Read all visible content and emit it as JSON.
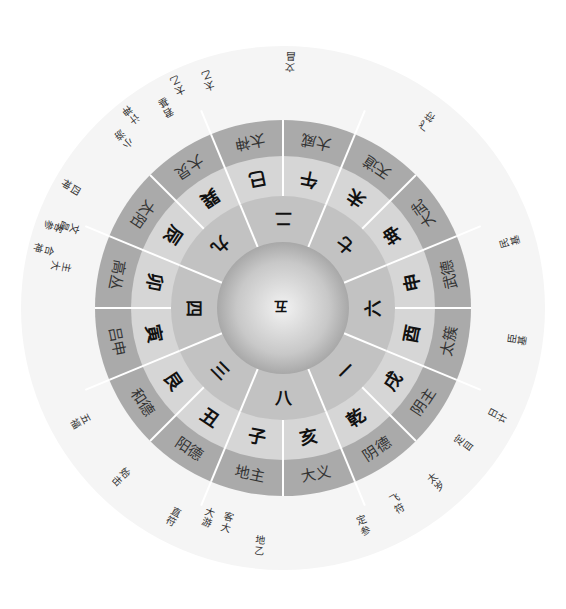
{
  "diagram": {
    "type": "circular-cosmogram",
    "center": {
      "label": "五"
    },
    "rotation_deg": 180,
    "numbers_ring": [
      {
        "label": "二",
        "angle": 0
      },
      {
        "label": "七",
        "angle": 45
      },
      {
        "label": "六",
        "angle": 90
      },
      {
        "label": "一",
        "angle": 135
      },
      {
        "label": "八",
        "angle": 180
      },
      {
        "label": "三",
        "angle": 225
      },
      {
        "label": "四",
        "angle": 270
      },
      {
        "label": "九",
        "angle": 315
      }
    ],
    "branch_ring": [
      {
        "label": "巳",
        "angle": -11.25
      },
      {
        "label": "午",
        "angle": 11.25
      },
      {
        "label": "未",
        "angle": 33.75
      },
      {
        "label": "坤",
        "angle": 56.25
      },
      {
        "label": "申",
        "angle": 78.75
      },
      {
        "label": "酉",
        "angle": 101.25
      },
      {
        "label": "戌",
        "angle": 123.75
      },
      {
        "label": "乾",
        "angle": 146.25
      },
      {
        "label": "亥",
        "angle": 168.75
      },
      {
        "label": "子",
        "angle": 191.25
      },
      {
        "label": "丑",
        "angle": 213.75
      },
      {
        "label": "艮",
        "angle": 236.25
      },
      {
        "label": "寅",
        "angle": 258.75
      },
      {
        "label": "卯",
        "angle": 281.25
      },
      {
        "label": "辰",
        "angle": 303.75
      },
      {
        "label": "巽",
        "angle": 326.25
      }
    ],
    "deity_ring": [
      {
        "label": "太神",
        "angle": -11.25
      },
      {
        "label": "大威",
        "angle": 11.25
      },
      {
        "label": "天道",
        "angle": 33.75
      },
      {
        "label": "大武",
        "angle": 56.25
      },
      {
        "label": "武德",
        "angle": 78.75
      },
      {
        "label": "太簇",
        "angle": 101.25
      },
      {
        "label": "阴主",
        "angle": 123.75
      },
      {
        "label": "阴德",
        "angle": 146.25
      },
      {
        "label": "大义",
        "angle": 168.75
      },
      {
        "label": "地主",
        "angle": 191.25
      },
      {
        "label": "阳德",
        "angle": 213.75
      },
      {
        "label": "和德",
        "angle": 236.25
      },
      {
        "label": "吕申",
        "angle": 258.75
      },
      {
        "label": "高丛",
        "angle": 281.25
      },
      {
        "label": "太阳",
        "angle": 303.75
      },
      {
        "label": "大炅",
        "angle": 326.25
      }
    ],
    "outer_labels": [
      {
        "label": "文昌",
        "angle": 2,
        "r": 246
      },
      {
        "label": "飞符",
        "angle": 38,
        "r": 236
      },
      {
        "label": "民基",
        "angle": 74,
        "r": 236
      },
      {
        "label": "臣基",
        "angle": 98,
        "r": 236
      },
      {
        "label": "日计",
        "angle": 117,
        "r": 240
      },
      {
        "label": "定目",
        "angle": 127,
        "r": 226
      },
      {
        "label": "太岁",
        "angle": 139,
        "r": 232
      },
      {
        "label": "飞符",
        "angle": 150,
        "r": 226
      },
      {
        "label": "定参",
        "angle": 160,
        "r": 232
      },
      {
        "label": "地乙",
        "angle": 186,
        "r": 238
      },
      {
        "label": "客大",
        "angle": 195,
        "r": 222
      },
      {
        "label": "大游",
        "angle": 200,
        "r": 222
      },
      {
        "label": "直符",
        "angle": 208,
        "r": 236
      },
      {
        "label": "始击",
        "angle": 224,
        "r": 234
      },
      {
        "label": "五福",
        "angle": 241,
        "r": 232
      },
      {
        "label": "主大",
        "angle": 281,
        "r": 226
      },
      {
        "label": "合神",
        "angle": 284,
        "r": 246
      },
      {
        "label": "文昌",
        "angle": 291,
        "r": 228
      },
      {
        "label": "客参",
        "angle": 290,
        "r": 244
      },
      {
        "label": "四神",
        "angle": 300,
        "r": 244
      },
      {
        "label": "小游",
        "angle": 317,
        "r": 232
      },
      {
        "label": "计神",
        "angle": 322,
        "r": 246
      },
      {
        "label": "君基",
        "angle": 330,
        "r": 232
      },
      {
        "label": "太乙",
        "angle": 335,
        "r": 246
      },
      {
        "label": "太乙",
        "angle": 342,
        "r": 240
      }
    ],
    "colors": {
      "outer_band": "#a9a9a9",
      "branch_band": "#d4d4d4",
      "number_band": "#bfbfbf",
      "hub_light": "#f0f0f0",
      "hub_dark": "#a6a6a6",
      "divider": "#ffffff",
      "outer_halo": "#f4f4f4"
    }
  }
}
